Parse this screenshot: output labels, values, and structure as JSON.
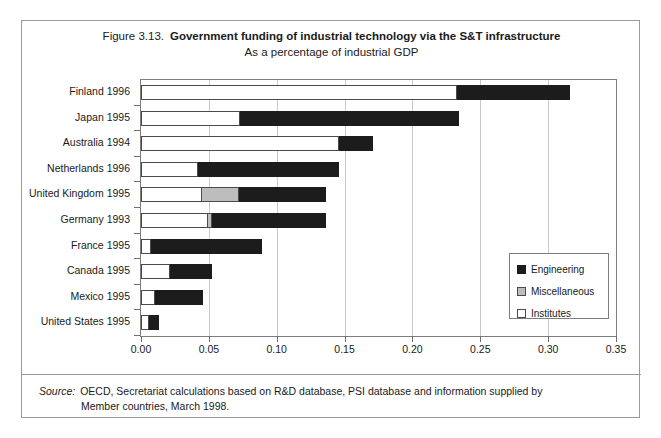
{
  "figure": {
    "number": "Figure 3.13.",
    "title": "Government funding of industrial technology via the S&T infrastructure",
    "subtitle": "As a percentage of industrial GDP"
  },
  "source": {
    "label": "Source:",
    "line1": "OECD, Secretariat calculations based on R&D database, PSI database and information supplied by",
    "line2": "Member countries, March 1998."
  },
  "legend": {
    "position": "inside-right",
    "items": [
      {
        "label": "Engineering",
        "color": "#1c1c1c",
        "swatch": "eng"
      },
      {
        "label": "Miscellaneous",
        "color": "#bdbdbd",
        "swatch": "misc"
      },
      {
        "label": "Institutes",
        "color": "#ffffff",
        "swatch": "inst"
      }
    ]
  },
  "chart_data": {
    "type": "bar",
    "orientation": "horizontal",
    "stacked": true,
    "title": "Government funding of industrial technology via the S&T infrastructure",
    "subtitle": "As a percentage of industrial GDP",
    "xlabel": "",
    "ylabel": "",
    "xlim": [
      0.0,
      0.35
    ],
    "xticks": [
      0.0,
      0.05,
      0.1,
      0.15,
      0.2,
      0.25,
      0.3,
      0.35
    ],
    "xtick_labels": [
      "0.00",
      "0.05",
      "0.10",
      "0.15",
      "0.20",
      "0.25",
      "0.30",
      "0.35"
    ],
    "grid": "vertical",
    "categories": [
      "Finland 1996",
      "Japan 1995",
      "Australia 1994",
      "Netherlands 1996",
      "United Kingdom 1995",
      "Germany 1993",
      "France 1995",
      "Canada 1995",
      "Mexico 1995",
      "United States 1995"
    ],
    "series": [
      {
        "name": "Institutes",
        "color": "#ffffff",
        "values": [
          0.233,
          0.073,
          0.146,
          0.042,
          0.045,
          0.049,
          0.007,
          0.021,
          0.01,
          0.006
        ]
      },
      {
        "name": "Miscellaneous",
        "color": "#bdbdbd",
        "values": [
          0.0,
          0.0,
          0.0,
          0.0,
          0.027,
          0.003,
          0.0,
          0.0,
          0.0,
          0.0
        ]
      },
      {
        "name": "Engineering",
        "color": "#1c1c1c",
        "values": [
          0.083,
          0.161,
          0.025,
          0.104,
          0.064,
          0.084,
          0.082,
          0.031,
          0.036,
          0.007
        ]
      }
    ],
    "totals": [
      0.316,
      0.234,
      0.171,
      0.146,
      0.136,
      0.136,
      0.089,
      0.052,
      0.046,
      0.013
    ]
  }
}
